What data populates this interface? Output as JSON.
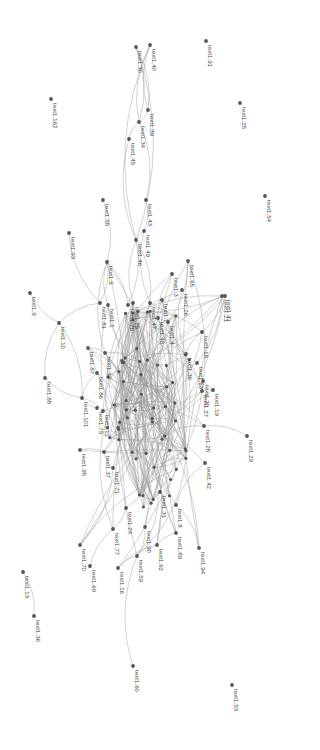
{
  "diagram": {
    "type": "network-graph",
    "label_rotation": 90,
    "colors": {
      "background": "#ffffff",
      "node": "#555555",
      "edge": "#9a9a9a",
      "label": "#444444"
    },
    "nodes": [
      {
        "id": "30",
        "label": "text1.30",
        "x": 136,
        "y": 47
      },
      {
        "id": "40",
        "label": "text1.40",
        "x": 150,
        "y": 45
      },
      {
        "id": "39",
        "label": "text1.39",
        "x": 148,
        "y": 110
      },
      {
        "id": "34",
        "label": "text1.34",
        "x": 139,
        "y": 122
      },
      {
        "id": "45",
        "label": "text1.45",
        "x": 129,
        "y": 139
      },
      {
        "id": "43",
        "label": "text1.43",
        "x": 146,
        "y": 200
      },
      {
        "id": "49",
        "label": "text1.49",
        "x": 144,
        "y": 231
      },
      {
        "id": "46",
        "label": "text1.46",
        "x": 136,
        "y": 240
      },
      {
        "id": "58",
        "label": "text1.58",
        "x": 103,
        "y": 200
      },
      {
        "id": "91",
        "label": "text1.91",
        "x": 206,
        "y": 41
      },
      {
        "id": "25",
        "label": "text1.25",
        "x": 240,
        "y": 103
      },
      {
        "id": "54",
        "label": "text1.54",
        "x": 265,
        "y": 196
      },
      {
        "id": "162",
        "label": "text1.162",
        "x": 51,
        "y": 99
      },
      {
        "id": "93",
        "label": "text1.93",
        "x": 69,
        "y": 233
      },
      {
        "id": "5",
        "label": "text1.5",
        "x": 107,
        "y": 262
      },
      {
        "id": "7",
        "label": "text1.7",
        "x": 162,
        "y": 300
      },
      {
        "id": "3",
        "label": "text1.3",
        "x": 172,
        "y": 274
      },
      {
        "id": "65",
        "label": "text1.65",
        "x": 188,
        "y": 261
      },
      {
        "id": "26",
        "label": "text1.26",
        "x": 182,
        "y": 290
      },
      {
        "id": "41",
        "label": "text1.41",
        "x": 225,
        "y": 296
      },
      {
        "id": "9",
        "label": "text1.9",
        "x": 30,
        "y": 293
      },
      {
        "id": "81",
        "label": "text1.81",
        "x": 100,
        "y": 303
      },
      {
        "id": "1",
        "label": "text1.1",
        "x": 108,
        "y": 305
      },
      {
        "id": "76",
        "label": "text1.76",
        "x": 128,
        "y": 305
      },
      {
        "id": "75",
        "label": "text1.75",
        "x": 133,
        "y": 303
      },
      {
        "id": "47",
        "label": "text1.47",
        "x": 150,
        "y": 303
      },
      {
        "id": "48",
        "label": "text1.48",
        "x": 158,
        "y": 318
      },
      {
        "id": "4",
        "label": "text1.4",
        "x": 168,
        "y": 322
      },
      {
        "id": "18",
        "label": "text1.18",
        "x": 202,
        "y": 332
      },
      {
        "id": "21",
        "label": "text1.21",
        "x": 222,
        "y": 296
      },
      {
        "id": "10",
        "label": "text1.10",
        "x": 59,
        "y": 323
      },
      {
        "id": "87",
        "label": "text1.87",
        "x": 88,
        "y": 348
      },
      {
        "id": "33",
        "label": "text1.33",
        "x": 105,
        "y": 353
      },
      {
        "id": "36",
        "label": "text1.36",
        "x": 186,
        "y": 354
      },
      {
        "id": "63",
        "label": "text1.63",
        "x": 197,
        "y": 363
      },
      {
        "id": "88",
        "label": "text1.88",
        "x": 45,
        "y": 378
      },
      {
        "id": "86",
        "label": "text1.86",
        "x": 97,
        "y": 373
      },
      {
        "id": "101",
        "label": "text1.101",
        "x": 82,
        "y": 398
      },
      {
        "id": "20",
        "label": "text1.20",
        "x": 203,
        "y": 381
      },
      {
        "id": "27",
        "label": "text1.27",
        "x": 202,
        "y": 391
      },
      {
        "id": "19",
        "label": "text1.19",
        "x": 213,
        "y": 390
      },
      {
        "id": "79",
        "label": "text1.79",
        "x": 97,
        "y": 408
      },
      {
        "id": "12",
        "label": "text1.12",
        "x": 103,
        "y": 411
      },
      {
        "id": "39b",
        "label": "text1.28",
        "x": 204,
        "y": 426
      },
      {
        "id": "29",
        "label": "text1.29",
        "x": 247,
        "y": 436
      },
      {
        "id": "95",
        "label": "text1.95",
        "x": 80,
        "y": 450
      },
      {
        "id": "37",
        "label": "text1.37",
        "x": 104,
        "y": 452
      },
      {
        "id": "42",
        "label": "text1.42",
        "x": 205,
        "y": 463
      },
      {
        "id": "71",
        "label": "text1.71",
        "x": 113,
        "y": 468
      },
      {
        "id": "31",
        "label": "text1.31",
        "x": 160,
        "y": 492
      },
      {
        "id": "24",
        "label": "text1.24",
        "x": 126,
        "y": 508
      },
      {
        "id": "8",
        "label": "text1.8",
        "x": 176,
        "y": 505
      },
      {
        "id": "70",
        "label": "text1.70",
        "x": 80,
        "y": 545
      },
      {
        "id": "77",
        "label": "text1.77",
        "x": 113,
        "y": 529
      },
      {
        "id": "90",
        "label": "text1.90",
        "x": 145,
        "y": 527
      },
      {
        "id": "62",
        "label": "text1.62",
        "x": 157,
        "y": 545
      },
      {
        "id": "89",
        "label": "text1.89",
        "x": 176,
        "y": 533
      },
      {
        "id": "94",
        "label": "text1.94",
        "x": 199,
        "y": 548
      },
      {
        "id": "69",
        "label": "text1.69",
        "x": 90,
        "y": 566
      },
      {
        "id": "16",
        "label": "text1.16",
        "x": 118,
        "y": 568
      },
      {
        "id": "59",
        "label": "text1.59",
        "x": 137,
        "y": 556
      },
      {
        "id": "13",
        "label": "text1.13",
        "x": 23,
        "y": 572
      },
      {
        "id": "36b",
        "label": "text1.36",
        "x": 34,
        "y": 616
      },
      {
        "id": "60",
        "label": "text1.60",
        "x": 133,
        "y": 666
      },
      {
        "id": "53",
        "label": "text1.53",
        "x": 232,
        "y": 685
      }
    ],
    "edges": [
      [
        "30",
        "34"
      ],
      [
        "40",
        "39"
      ],
      [
        "30",
        "46"
      ],
      [
        "40",
        "46"
      ],
      [
        "39",
        "34"
      ],
      [
        "34",
        "45"
      ],
      [
        "34",
        "43"
      ],
      [
        "45",
        "46"
      ],
      [
        "43",
        "49"
      ],
      [
        "49",
        "46"
      ],
      [
        "30",
        "39"
      ],
      [
        "40",
        "34"
      ],
      [
        "58",
        "5"
      ],
      [
        "93",
        "81"
      ],
      [
        "5",
        "81"
      ],
      [
        "5",
        "1"
      ],
      [
        "5",
        "76"
      ],
      [
        "5",
        "33"
      ],
      [
        "46",
        "76"
      ],
      [
        "46",
        "75"
      ],
      [
        "46",
        "47"
      ],
      [
        "49",
        "47"
      ],
      [
        "7",
        "48"
      ],
      [
        "3",
        "48"
      ],
      [
        "65",
        "4"
      ],
      [
        "26",
        "36"
      ],
      [
        "41",
        "18"
      ],
      [
        "9",
        "10"
      ],
      [
        "10",
        "81"
      ],
      [
        "10",
        "88"
      ],
      [
        "10",
        "101"
      ],
      [
        "88",
        "101"
      ],
      [
        "87",
        "33"
      ],
      [
        "86",
        "101"
      ],
      [
        "101",
        "12"
      ],
      [
        "101",
        "79"
      ],
      [
        "21",
        "63"
      ],
      [
        "18",
        "36"
      ],
      [
        "20",
        "27"
      ],
      [
        "19",
        "27"
      ],
      [
        "39b",
        "29"
      ],
      [
        "42",
        "8"
      ],
      [
        "95",
        "37"
      ],
      [
        "37",
        "71"
      ],
      [
        "71",
        "70"
      ],
      [
        "77",
        "69"
      ],
      [
        "24",
        "77"
      ],
      [
        "31",
        "90"
      ],
      [
        "8",
        "94"
      ],
      [
        "89",
        "62"
      ],
      [
        "90",
        "59"
      ],
      [
        "62",
        "16"
      ],
      [
        "13",
        "36b"
      ],
      [
        "59",
        "60"
      ],
      [
        "16",
        "59"
      ]
    ],
    "dense_core": {
      "cx": 148,
      "cy": 400,
      "rx": 45,
      "ry": 110,
      "node_count": 60
    }
  }
}
